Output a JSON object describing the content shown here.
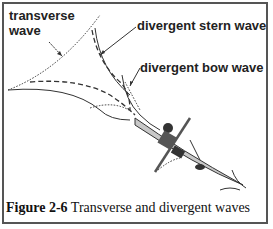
{
  "figure": {
    "number": "Figure 2-6",
    "caption": "Transverse and divergent waves"
  },
  "labels": {
    "transverse": [
      "transverse",
      "wave"
    ],
    "stern": "divergent stern wave",
    "bow": "divergent bow wave"
  },
  "colors": {
    "border": "#555555",
    "line": "#333333",
    "kayak": "#c8c8c8"
  }
}
